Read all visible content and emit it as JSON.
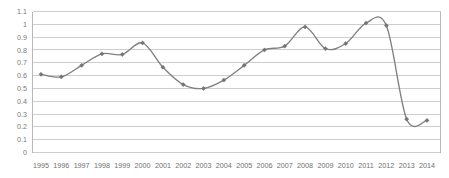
{
  "chart_data": {
    "type": "line",
    "title": "",
    "subtitle": "",
    "xlabel": "",
    "ylabel": "",
    "categories": [
      "1995",
      "1996",
      "1997",
      "1998",
      "1999",
      "2000",
      "2001",
      "2002",
      "2003",
      "2004",
      "2005",
      "2006",
      "2007",
      "2008",
      "2009",
      "2010",
      "2011",
      "2012",
      "2013",
      "2014"
    ],
    "values": [
      0.61,
      0.59,
      0.68,
      0.77,
      0.765,
      0.855,
      0.665,
      0.53,
      0.5,
      0.565,
      0.68,
      0.8,
      0.83,
      0.98,
      0.81,
      0.85,
      1.01,
      0.99,
      0.26,
      0.25
    ],
    "series": [
      {
        "name": "",
        "values": [
          0.61,
          0.59,
          0.68,
          0.77,
          0.765,
          0.855,
          0.665,
          0.53,
          0.5,
          0.565,
          0.68,
          0.8,
          0.83,
          0.98,
          0.81,
          0.85,
          1.01,
          0.99,
          0.26,
          0.25
        ]
      }
    ],
    "ylim": [
      0,
      1.1
    ],
    "ytick_labels": [
      "1.1",
      "1",
      "0.9",
      "0.8",
      "0.7",
      "0.6",
      "0.5",
      "0.4",
      "0.3",
      "0.2",
      "0.1",
      "0"
    ],
    "ytick_values": [
      1.1,
      1,
      0.9,
      0.8,
      0.7,
      0.6,
      0.5,
      0.4,
      0.3,
      0.2,
      0.1,
      0
    ],
    "xtick_labels": [
      "1995",
      "1996",
      "1997",
      "1998",
      "1999",
      "2000",
      "2001",
      "2002",
      "2003",
      "2004",
      "2005",
      "2006",
      "2007",
      "2008",
      "2009",
      "2010",
      "2011",
      "2012",
      "2013",
      "2014"
    ],
    "grid": true,
    "grid_axis": "y",
    "legend": false,
    "legend_position": "none",
    "annotations": [],
    "marker": "diamond",
    "line_color": "#808080",
    "marker_color": "#757575",
    "grid_color": "#b9b9b9",
    "background_color": "#ffffff",
    "smoothing": true
  }
}
